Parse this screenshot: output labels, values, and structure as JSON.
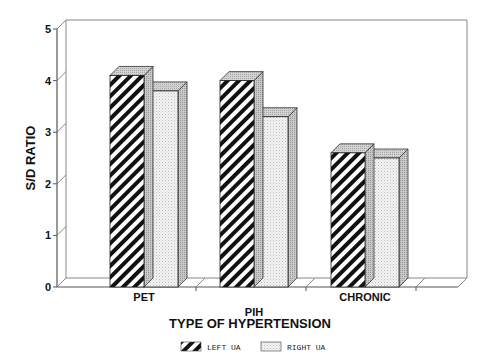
{
  "chart_data": {
    "type": "bar",
    "style": "3d-clustered",
    "title": "",
    "xlabel": "TYPE OF HYPERTENSION",
    "ylabel": "S/D RATIO",
    "ylim": [
      0,
      5
    ],
    "yticks": [
      0,
      1,
      2,
      3,
      4,
      5
    ],
    "grid": false,
    "legend_position": "bottom",
    "categories": [
      "PET",
      "PIH",
      "CHRONIC"
    ],
    "category_label_offsets": [
      0,
      1,
      0
    ],
    "series": [
      {
        "name": "LEFT UA",
        "pattern": "diagonal-hatch",
        "values": [
          4.1,
          4.0,
          2.6
        ]
      },
      {
        "name": "RIGHT UA",
        "pattern": "light-stipple",
        "values": [
          3.8,
          3.3,
          2.5
        ]
      }
    ]
  },
  "colors": {
    "axis": "#555555",
    "hatch_dark": "#111111",
    "stipple_base": "#f4f4f4",
    "stipple_dot": "#bbbbbb",
    "side_face": "#b8b8b8",
    "top_face": "#c6c6c6"
  },
  "legend": {
    "items": [
      {
        "label": "LEFT UA",
        "pattern": "diagonal-hatch"
      },
      {
        "label": "RIGHT UA",
        "pattern": "light-stipple"
      }
    ]
  }
}
